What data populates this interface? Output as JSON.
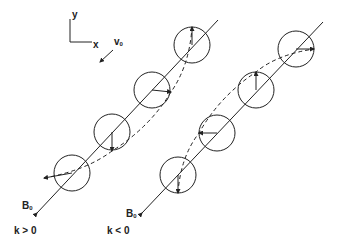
{
  "figure": {
    "type": "diagram",
    "axes": {
      "y_label": "y",
      "x_label": "x"
    },
    "velocity_label": {
      "main": "v",
      "sub": "0"
    },
    "panels": [
      {
        "id": "left",
        "field_label": {
          "main": "B",
          "sub": "0"
        },
        "condition": "k > 0",
        "circles": [
          [
            72,
            173
          ],
          [
            112,
            132
          ],
          [
            152,
            90
          ],
          [
            192,
            45
          ]
        ],
        "arrow_tips": [
          [
            44,
            178
          ],
          [
            112,
            151
          ],
          [
            171,
            92
          ],
          [
            192,
            27
          ]
        ],
        "line": [
          [
            37,
            213
          ],
          [
            218,
            20
          ]
        ]
      },
      {
        "id": "right",
        "field_label": {
          "main": "B",
          "sub": "0"
        },
        "condition": "k < 0",
        "circles": [
          [
            178,
            175
          ],
          [
            217,
            133
          ],
          [
            256,
            90
          ],
          [
            296,
            49
          ]
        ],
        "arrow_tips": [
          [
            178,
            193
          ],
          [
            199,
            133
          ],
          [
            256,
            72
          ],
          [
            314,
            49
          ]
        ],
        "line": [
          [
            142,
            213
          ],
          [
            323,
            22
          ]
        ]
      }
    ],
    "colors": {
      "ink": "#222222",
      "background": "#ffffff"
    }
  }
}
